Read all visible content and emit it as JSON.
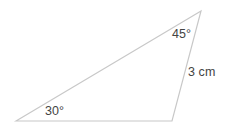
{
  "figure": {
    "name": "triangle-with-angle-and-side-labels",
    "background_color": "#ffffff",
    "width": 232,
    "height": 131,
    "stroke_color": "#c8c8c8",
    "stroke_width": 1.2,
    "text_color": "#444444"
  },
  "shape": {
    "type": "triangle",
    "vertices": [
      {
        "id": "bottom-left",
        "x": 16,
        "y": 121
      },
      {
        "id": "apex-top-right",
        "x": 201,
        "y": 11
      },
      {
        "id": "bottom-right",
        "x": 172,
        "y": 121
      }
    ],
    "path": "M 16 121 L 201 11 L 172 121 Z"
  },
  "labels": {
    "angle_a": "30°",
    "angle_b": "45°",
    "side": "3 cm"
  }
}
